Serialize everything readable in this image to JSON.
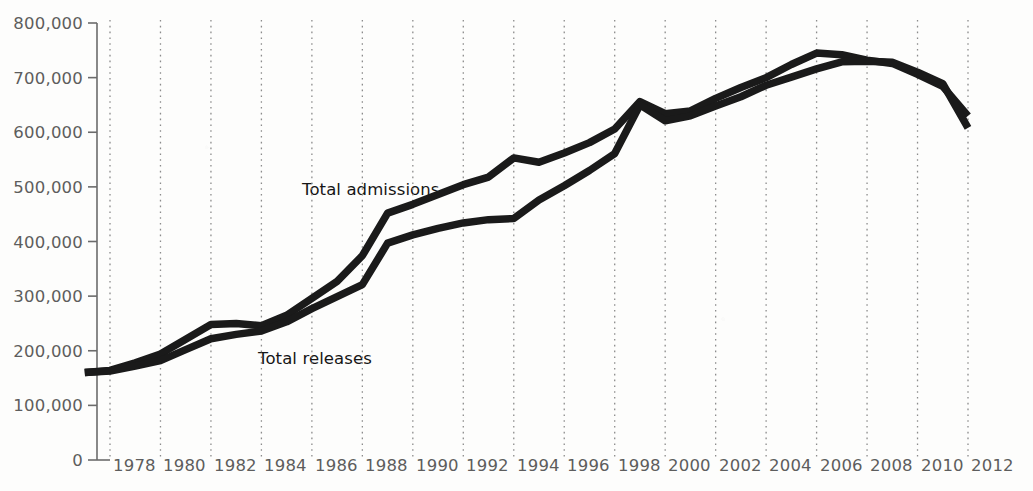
{
  "chart_data": {
    "type": "line",
    "title": "",
    "subtitle": "",
    "xlabel": "",
    "ylabel": "",
    "grid": "vertical-dotted",
    "legend_position": "inline-annotation",
    "xlim": [
      1977,
      2012
    ],
    "ylim": [
      0,
      800000
    ],
    "x_tick_labels": [
      "1978",
      "1980",
      "1982",
      "1984",
      "1986",
      "1988",
      "1990",
      "1992",
      "1994",
      "1996",
      "1998",
      "2000",
      "2002",
      "2004",
      "2006",
      "2008",
      "2010",
      "2012"
    ],
    "x_tick_values": [
      1978,
      1980,
      1982,
      1984,
      1986,
      1988,
      1990,
      1992,
      1994,
      1996,
      1998,
      2000,
      2002,
      2004,
      2006,
      2008,
      2010,
      2012
    ],
    "y_tick_labels": [
      "0",
      "100,000",
      "200,000",
      "300,000",
      "400,000",
      "500,000",
      "600,000",
      "700,000",
      "800,000"
    ],
    "y_tick_values": [
      0,
      100000,
      200000,
      300000,
      400000,
      500000,
      600000,
      700000,
      800000
    ],
    "x": [
      1977,
      1978,
      1979,
      1980,
      1981,
      1982,
      1983,
      1984,
      1985,
      1986,
      1987,
      1988,
      1989,
      1990,
      1991,
      1992,
      1993,
      1994,
      1995,
      1996,
      1997,
      1998,
      1999,
      2000,
      2001,
      2002,
      2003,
      2004,
      2005,
      2006,
      2007,
      2008,
      2009,
      2010,
      2011,
      2012
    ],
    "series": [
      {
        "name": "Total admissions",
        "color": "#1a1a1a",
        "values": [
          160000,
          164000,
          178000,
          194000,
          221000,
          248000,
          250000,
          246000,
          265000,
          296000,
          327000,
          374000,
          452000,
          468000,
          486000,
          504000,
          518000,
          553000,
          545000,
          562000,
          581000,
          606000,
          656000,
          634000,
          639000,
          662000,
          682000,
          700000,
          724000,
          745000,
          742000,
          732000,
          726000,
          706000,
          684000,
          630000
        ]
      },
      {
        "name": "Total releases",
        "color": "#1a1a1a",
        "values": [
          160000,
          163000,
          172000,
          182000,
          202000,
          222000,
          230000,
          236000,
          253000,
          277000,
          299000,
          321000,
          397000,
          412000,
          424000,
          434000,
          440000,
          442000,
          476000,
          502000,
          530000,
          561000,
          650000,
          621000,
          630000,
          648000,
          665000,
          686000,
          701000,
          716000,
          729000,
          730000,
          728000,
          710000,
          689000,
          608000
        ]
      }
    ],
    "annotations": [
      {
        "text": "Total admissions",
        "series": "Total admissions"
      },
      {
        "text": "Total releases",
        "series": "Total releases"
      }
    ]
  },
  "colors": {
    "line": "#1a1a1a",
    "axis": "#6b6b6b",
    "gridline": "#8c8c8c",
    "tick_text": "#5d5d5d",
    "annotation_text": "#161616",
    "background": "#fdfdfc"
  }
}
